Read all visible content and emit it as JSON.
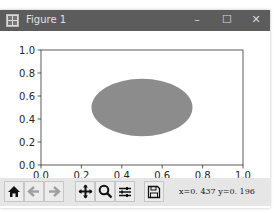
{
  "window": {
    "title": "Figure 1",
    "minimize_label": "–",
    "maximize_label": "☐",
    "close_label": "✕"
  },
  "toolbar": {
    "buttons": [
      {
        "name": "home",
        "icon": "home-icon"
      },
      {
        "name": "back",
        "icon": "arrow-left-icon"
      },
      {
        "name": "forward",
        "icon": "arrow-right-icon"
      },
      {
        "name": "pan",
        "icon": "move-icon"
      },
      {
        "name": "zoom",
        "icon": "magnifier-icon"
      },
      {
        "name": "configure-subplots",
        "icon": "sliders-icon"
      },
      {
        "name": "save",
        "icon": "floppy-disk-icon"
      }
    ],
    "coordinates": "x=0. 437  y=0. 196"
  },
  "chart_data": {
    "type": "patch",
    "title": "",
    "xlabel": "",
    "ylabel": "",
    "xlim": [
      0.0,
      1.0
    ],
    "ylim": [
      0.0,
      1.0
    ],
    "xticks": [
      "0.0",
      "0.2",
      "0.4",
      "0.6",
      "0.8",
      "1.0"
    ],
    "yticks": [
      "0.0",
      "0.2",
      "0.4",
      "0.6",
      "0.8",
      "1.0"
    ],
    "grid": false,
    "shapes": [
      {
        "kind": "ellipse",
        "center": [
          0.5,
          0.5
        ],
        "width": 0.5,
        "height": 0.5,
        "fill": "#8c8c8c"
      }
    ]
  }
}
